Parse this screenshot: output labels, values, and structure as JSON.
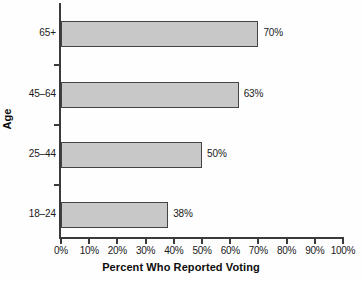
{
  "chart_data": {
    "type": "bar",
    "orientation": "horizontal",
    "title": "",
    "xlabel": "Percent Who Reported Voting",
    "ylabel": "Age",
    "categories": [
      "65+",
      "45–64",
      "25–44",
      "18–24"
    ],
    "values": [
      70,
      63,
      50,
      38
    ],
    "value_labels": [
      "70%",
      "63%",
      "50%",
      "38%"
    ],
    "xlim": [
      0,
      100
    ],
    "xticks": [
      0,
      10,
      20,
      30,
      40,
      50,
      60,
      70,
      80,
      90,
      100
    ],
    "xtick_labels": [
      "0%",
      "10%",
      "20%",
      "30%",
      "40%",
      "50%",
      "60%",
      "70%",
      "80%",
      "90%",
      "100%"
    ],
    "grid": false,
    "legend": null,
    "bar_fill_color": "#c8c8c8",
    "bar_border_color": "#444444",
    "axis_color": "#3a3a3a",
    "background_color": "#fefefe"
  }
}
